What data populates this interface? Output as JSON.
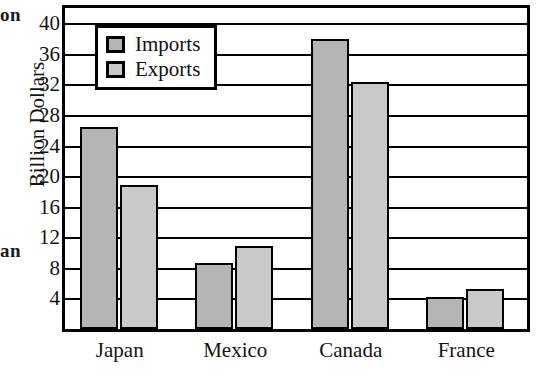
{
  "edge_fragments": {
    "top": "on",
    "middle": "an"
  },
  "chart_data": {
    "type": "bar",
    "title": "",
    "xlabel": "",
    "ylabel": "Billion Dollars",
    "categories": [
      "Japan",
      "Mexico",
      "Canada",
      "France"
    ],
    "series": [
      {
        "name": "Imports",
        "values": [
          26.4,
          8.7,
          38.0,
          4.2
        ],
        "color": "#b5b5b5"
      },
      {
        "name": "Exports",
        "values": [
          18.8,
          10.8,
          32.3,
          5.2
        ],
        "color": "#c9c9c9"
      }
    ],
    "ylim": [
      0,
      42
    ],
    "yticks": [
      4,
      8,
      12,
      16,
      20,
      24,
      28,
      32,
      36,
      40
    ],
    "ytick_labels": [
      "4",
      "8",
      "12",
      "16",
      "20",
      "24",
      "28",
      "32",
      "36",
      "40"
    ],
    "grid": true,
    "legend_position": "top-left",
    "legend_entries": [
      "Imports",
      "Exports"
    ]
  }
}
